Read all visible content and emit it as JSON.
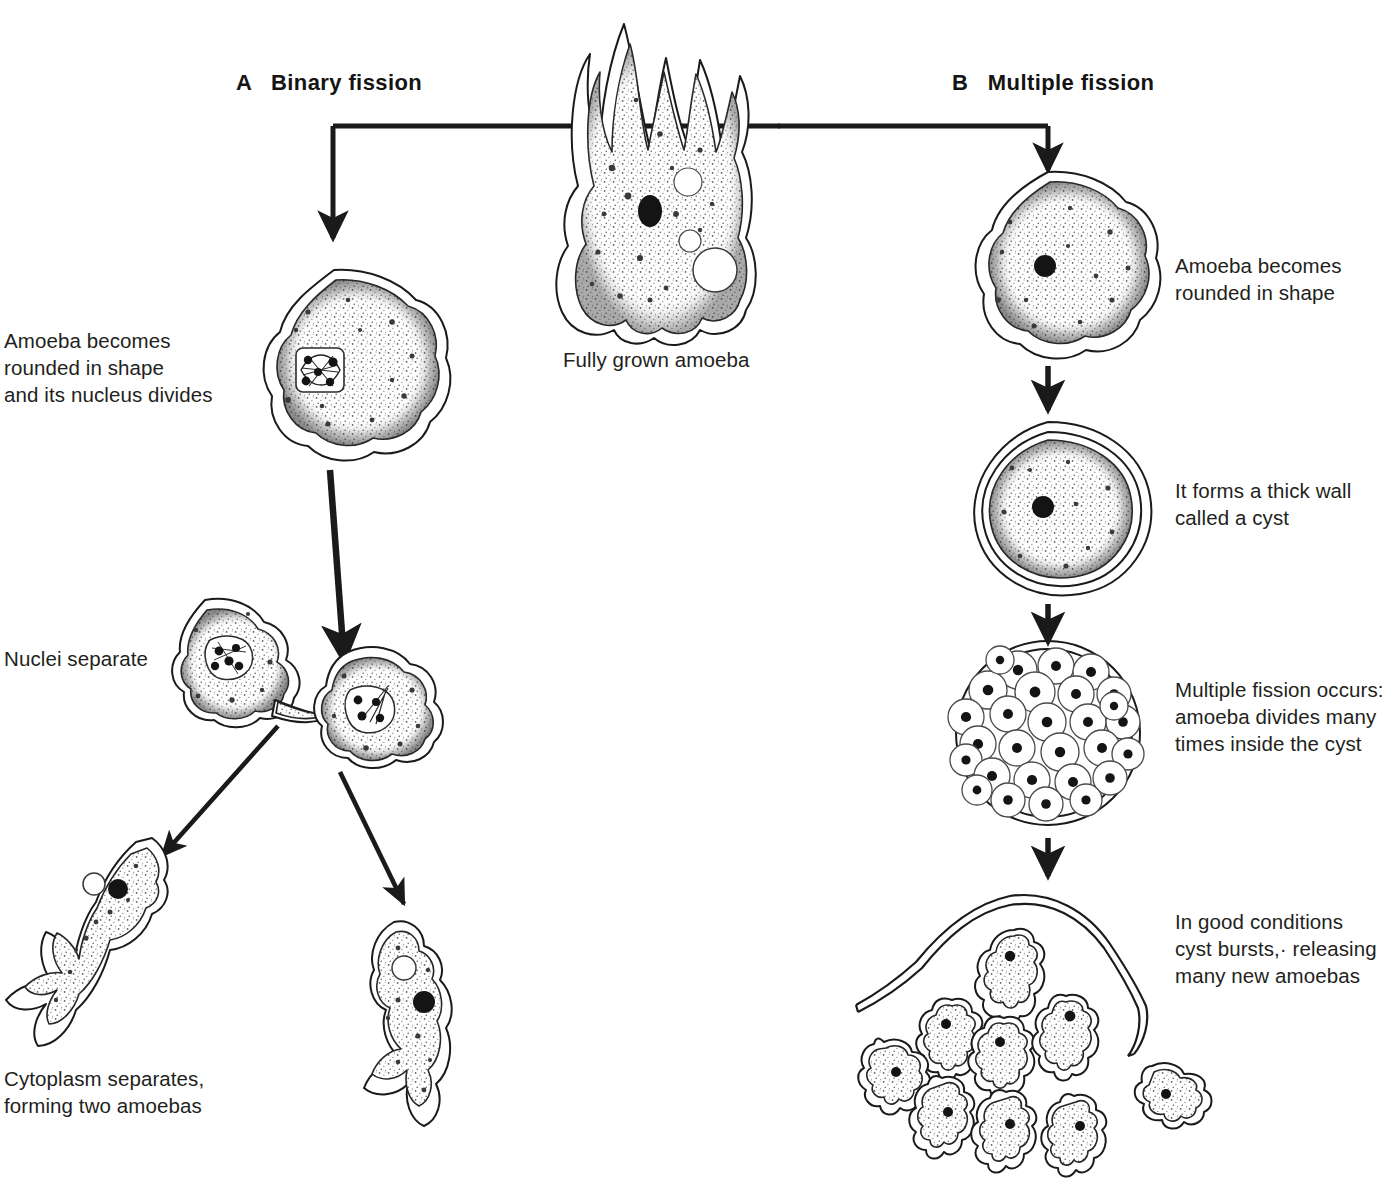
{
  "figure": {
    "center_caption": "Fully grown amoeba"
  },
  "headings": {
    "left": "A   Binary fission",
    "right": "B   Multiple fission"
  },
  "left_branch": {
    "name": "Binary fission",
    "steps": [
      {
        "id": "rounded-dividing-nucleus",
        "label": "Amoeba becomes\nrounded in shape\nand its nucleus divides"
      },
      {
        "id": "nuclei-separate",
        "label": "Nuclei separate"
      },
      {
        "id": "cytoplasm-separates",
        "label": "Cytoplasm  separates,\nforming two amoebas"
      }
    ]
  },
  "right_branch": {
    "name": "Multiple fission",
    "steps": [
      {
        "id": "rounded",
        "label": "Amoeba becomes\nrounded in shape"
      },
      {
        "id": "cyst-wall",
        "label": "It forms a thick wall\ncalled a cyst"
      },
      {
        "id": "multiple-fission",
        "label": "Multiple fission occurs:\namoeba divides many\ntimes inside the cyst"
      },
      {
        "id": "cyst-bursts",
        "label": "In good conditions\ncyst bursts,· releasing\nmany new amoebas"
      }
    ]
  },
  "counts": {
    "daughter_cells_in_cyst": 28,
    "released_amoebas": 9,
    "binary_fission_daughters": 2
  },
  "colors": {
    "ink": "#1a1a1a",
    "text": "#231f20",
    "paper": "#ffffff",
    "nucleus": "#141414",
    "stipple": "#4a4a4a"
  },
  "icons": {
    "branch_arrow": "arrow-down-icon",
    "flow_arrow": "arrow-down-icon",
    "diagonal_arrow": "arrow-diagonal-icon"
  }
}
